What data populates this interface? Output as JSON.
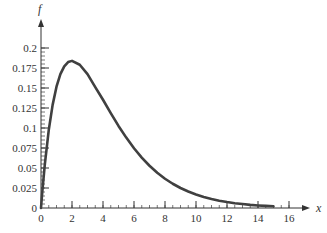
{
  "chart_data": {
    "type": "line",
    "title": "",
    "xlabel": "x",
    "ylabel": "f",
    "xlim": [
      0,
      16
    ],
    "ylim": [
      0,
      0.2
    ],
    "x_ticks": [
      0,
      2,
      4,
      6,
      8,
      10,
      12,
      14,
      16
    ],
    "x_tick_labels": [
      "0",
      "2",
      "4",
      "6",
      "8",
      "10",
      "12",
      "14",
      "16"
    ],
    "x_minor_step": 0.5,
    "y_ticks": [
      0,
      0.025,
      0.05,
      0.075,
      0.1,
      0.125,
      0.15,
      0.175,
      0.2
    ],
    "y_tick_labels": [
      "0",
      "0.025",
      "0.05",
      "0.075",
      "0.1",
      "0.125",
      "0.15",
      "0.175",
      "0.2"
    ],
    "y_minor_step": 0.005,
    "grid": false,
    "legend": null,
    "series": [
      {
        "name": "f(x)",
        "color": "#404040",
        "x": [
          0,
          0.1,
          0.25,
          0.5,
          0.75,
          1,
          1.25,
          1.5,
          1.75,
          2,
          2.5,
          3,
          3.5,
          4,
          4.5,
          5,
          5.5,
          6,
          6.5,
          7,
          7.5,
          8,
          8.5,
          9,
          9.5,
          10,
          10.5,
          11,
          11.5,
          12,
          12.5,
          13,
          13.5,
          14,
          14.5,
          15
        ],
        "y": [
          0,
          0.0238,
          0.0551,
          0.0974,
          0.1289,
          0.1516,
          0.1673,
          0.1771,
          0.1824,
          0.1839,
          0.1791,
          0.1673,
          0.151,
          0.1353,
          0.1186,
          0.1026,
          0.088,
          0.0747,
          0.063,
          0.0528,
          0.044,
          0.0366,
          0.0303,
          0.025,
          0.0206,
          0.0168,
          0.0137,
          0.0112,
          0.0091,
          0.0074,
          0.006,
          0.0049,
          0.0039,
          0.0032,
          0.0026,
          0.0021
        ]
      }
    ]
  },
  "labels": {
    "x_axis": "x",
    "y_axis": "f"
  }
}
